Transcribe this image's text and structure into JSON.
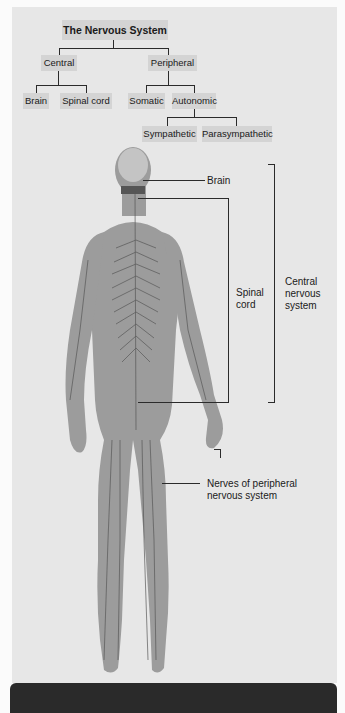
{
  "tree": {
    "root": "The Nervous System",
    "central": {
      "label": "Central",
      "children": [
        "Brain",
        "Spinal cord"
      ]
    },
    "peripheral": {
      "label": "Peripheral",
      "somatic": "Somatic",
      "autonomic": {
        "label": "Autonomic",
        "children": [
          "Sympathetic",
          "Parasympathetic"
        ]
      }
    }
  },
  "figure": {
    "labels": {
      "brain": "Brain",
      "spinal_cord_line1": "Spinal",
      "spinal_cord_line2": "cord",
      "cns_line1": "Central",
      "cns_line2": "nervous",
      "cns_line3": "system",
      "pns_line1": "Nerves of peripheral",
      "pns_line2": "nervous system"
    }
  },
  "colors": {
    "panel": "#e7e7e7",
    "box": "#d4d4d4",
    "body": "#9a9a9a",
    "nerve": "#5a5a5a",
    "line": "#2b2b2b",
    "bar": "#2a2a2a"
  }
}
